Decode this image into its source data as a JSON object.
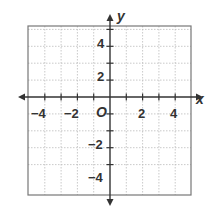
{
  "diagram": {
    "type": "coordinate-plane",
    "x_axis_label": "x",
    "y_axis_label": "y",
    "origin_label": "O",
    "x_range": [
      -5,
      5
    ],
    "y_range": [
      -5,
      5
    ],
    "grid_step": 1,
    "x_tick_labels": [
      "−4",
      "−2",
      "2",
      "4"
    ],
    "x_tick_values": [
      -4,
      -2,
      2,
      4
    ],
    "y_tick_labels": [
      "4",
      "2",
      "−2",
      "−4"
    ],
    "y_tick_values": [
      4,
      2,
      -2,
      -4
    ],
    "colors": {
      "grid": "#bbbbbb",
      "border": "#777777",
      "axis": "#333333"
    }
  }
}
